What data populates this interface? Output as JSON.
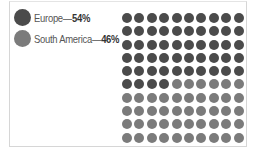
{
  "chart_data": {
    "type": "waffle",
    "title": "",
    "grid": {
      "rows": 10,
      "cols": 10,
      "fill_order": "row-major"
    },
    "categories": [
      "Europe",
      "South America"
    ],
    "values": [
      54,
      46
    ],
    "unit": "%",
    "colors": [
      "#4b4b4b",
      "#7b7b7b"
    ],
    "legend": [
      {
        "label": "Europe",
        "separator": "—",
        "value": "54%"
      },
      {
        "label": "South America",
        "separator": "—",
        "value": "46%"
      }
    ],
    "legend_position": "top-left"
  }
}
